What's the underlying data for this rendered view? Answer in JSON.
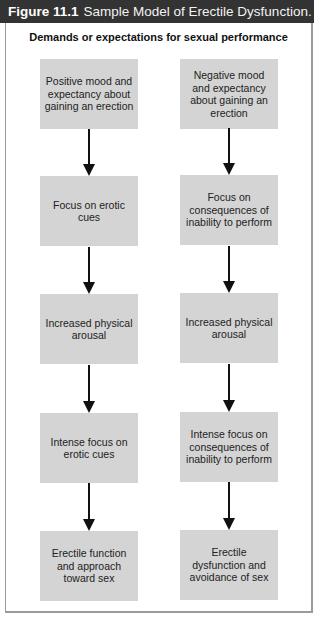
{
  "figure": {
    "number": "Figure 11.1",
    "title": "Sample Model of Erectile Dysfunction."
  },
  "diagram": {
    "top_label": "Demands or expectations for sexual performance",
    "left_column": [
      "Positive mood and expectancy about gaining an erection",
      "Focus on erotic cues",
      "Increased physical arousal",
      "Intense focus on erotic cues",
      "Erectile function and approach toward sex"
    ],
    "right_column": [
      "Negative mood and expectancy about gaining an erection",
      "Focus on consequences of inability to perform",
      "Increased physical arousal",
      "Intense focus on consequences of inability to perform",
      "Erectile dysfunction and avoidance of sex"
    ],
    "colors": {
      "header_bg": "#333333",
      "box_fill": "#d4d4d4",
      "arrow": "#111111",
      "frame": "#9a9a9a"
    }
  }
}
